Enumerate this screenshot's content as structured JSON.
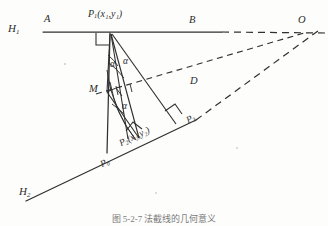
{
  "figure": {
    "caption": "图 5-2-7  法截线的几何意义",
    "labels": {
      "h1": "H",
      "h1_sub": "1",
      "h2": "H",
      "h2_sub": "2",
      "a": "A",
      "b": "B",
      "o": "O",
      "d": "D",
      "m": "M",
      "p1_main": "P",
      "p1_sub": "1",
      "p1_coords": "(x₁,y₁)",
      "p2_main": "P",
      "p2_sub": "2",
      "p2_coords": "(x₂,y₂)",
      "p_left": "P",
      "p_left_sub": "0",
      "p_mid": "P",
      "p_mid_sub": "3",
      "p_right": "P",
      "p_right_sub": "4",
      "alpha_upper_left": "α",
      "alpha_upper_right": "α",
      "alpha_lower": "α"
    },
    "colors": {
      "ink": "#2b2b2b",
      "line": "#303030",
      "paper": "#fdfdfc"
    },
    "geometry": {
      "horizontal_line": {
        "x1": 43,
        "y1": 32,
        "x2": 220,
        "y2": 32
      },
      "horizontal_dashed": {
        "x1": 220,
        "y1": 32,
        "x2": 325,
        "y2": 32
      },
      "slant_line": {
        "x1": 28,
        "y1": 199,
        "x2": 210,
        "y2": 112
      },
      "slant_dashed": {
        "x1": 210,
        "y1": 112,
        "x2": 322,
        "y2": 26
      },
      "p1": {
        "x": 111,
        "y": 33
      },
      "p2": {
        "x": 139,
        "y": 137
      },
      "m": {
        "x": 107,
        "y": 92
      },
      "p_left_pt": {
        "x": 107,
        "y": 152
      },
      "p_mid_pt": {
        "x": 172,
        "y": 121
      },
      "o_pt": {
        "x": 302,
        "y": 32
      },
      "vertical_drop": {
        "x1": 111,
        "y1": 33,
        "x2": 107,
        "y2": 152
      }
    }
  }
}
